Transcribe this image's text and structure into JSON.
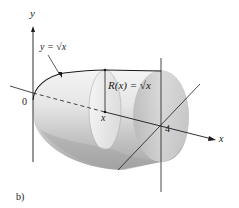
{
  "figure": {
    "caption": "b)",
    "labels": {
      "y_axis": "y",
      "x_axis": "x",
      "origin": "0",
      "x_point": "x",
      "x_end": "4",
      "curve": "y = √x",
      "radius": "R(x) = √x"
    },
    "colors": {
      "ink": "#1a1a1a",
      "solid_light": "#f2f2f2",
      "solid_mid": "#c9c9c9",
      "solid_dark": "#9a9a9a"
    }
  }
}
